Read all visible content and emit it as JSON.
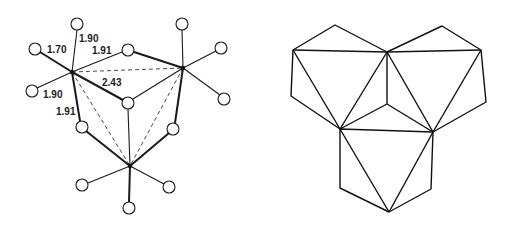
{
  "figure": {
    "left_panel": {
      "description": "Trinuclear metal cluster with octahedral coordination, shared bridging ligands and metal-metal contacts",
      "labels": {
        "bond_top": "1.90",
        "bond_terminal_short": "1.70",
        "bond_bridge_upper": "1.91",
        "metal_metal": "2.43",
        "bond_terminal_lower": "1.90",
        "bond_bridge_lower": "1.91"
      }
    },
    "right_panel": {
      "description": "Polyhedral representation: three edge/vertex-sharing octahedra around a common center"
    }
  }
}
